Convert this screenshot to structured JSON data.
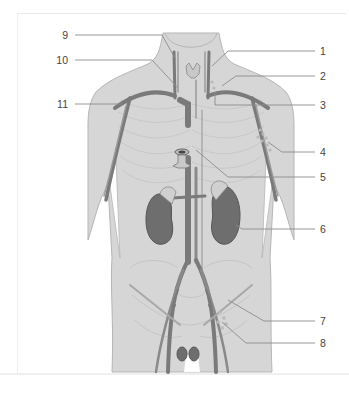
{
  "diagram": {
    "colors": {
      "body_fill": "#d4d4d4",
      "body_outline": "#b3b3b3",
      "vessel": "#7c7c7c",
      "vessel_light": "#a5a5a5",
      "kidney": "#6e6e6e",
      "leader_line": "#8a8a8a",
      "label_text": "#444444",
      "background": "#ffffff"
    },
    "labels": {
      "left": [
        {
          "id": "9",
          "text": "9"
        },
        {
          "id": "10",
          "text": "10"
        },
        {
          "id": "11",
          "text": "11"
        }
      ],
      "right": [
        {
          "id": "1",
          "text": "1"
        },
        {
          "id": "2",
          "text": "2"
        },
        {
          "id": "3",
          "text": "3"
        },
        {
          "id": "4",
          "text": "4"
        },
        {
          "id": "5",
          "text": "5"
        },
        {
          "id": "6",
          "text": "6"
        },
        {
          "id": "7",
          "text": "7"
        },
        {
          "id": "8",
          "text": "8"
        }
      ]
    }
  }
}
